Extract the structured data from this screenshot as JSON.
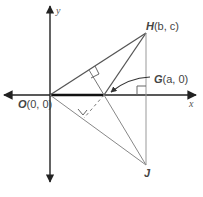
{
  "diagram": {
    "axes": {
      "x_label": "x",
      "y_label": "y"
    },
    "points": {
      "O": {
        "name": "O",
        "coords": "(0, 0)"
      },
      "G": {
        "name": "G",
        "coords": "(a, 0)"
      },
      "H": {
        "name": "H",
        "coords": "(b, c)"
      },
      "J": {
        "name": "J",
        "coords": ""
      }
    },
    "colors": {
      "axis": "#222222",
      "line": "#555555",
      "thin_line": "#888888",
      "label": "#444444"
    }
  }
}
